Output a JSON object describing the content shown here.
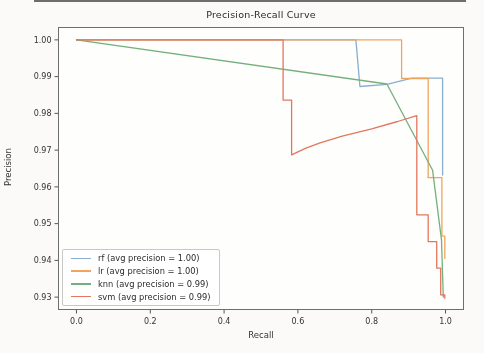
{
  "figure": {
    "title": "Precision-Recall Curve",
    "xlabel": "Recall",
    "ylabel": "Precision"
  },
  "chart_data": {
    "type": "line",
    "title": "Precision-Recall Curve",
    "xlabel": "Recall",
    "ylabel": "Precision",
    "xlim": [
      -0.05,
      1.05
    ],
    "ylim": [
      0.9265,
      1.0035
    ],
    "grid": false,
    "legend_position": "lower left",
    "x_ticks": [
      0.0,
      0.2,
      0.4,
      0.6,
      0.8,
      1.0
    ],
    "x_tick_labels": [
      "0.0",
      "0.2",
      "0.4",
      "0.6",
      "0.8",
      "1.0"
    ],
    "y_ticks": [
      1.0,
      0.99,
      0.98,
      0.97,
      0.96,
      0.95,
      0.94,
      0.93
    ],
    "y_tick_labels": [
      "1.00",
      "0.99",
      "0.98",
      "0.97",
      "0.96",
      "0.95",
      "0.94",
      "0.93"
    ],
    "series": [
      {
        "name": "rf",
        "label": "rf (avg precision = 1.00)",
        "avg_precision": "1.00",
        "color": "#8aaecd",
        "points": [
          [
            0.0,
            1.0
          ],
          [
            0.757,
            1.0
          ],
          [
            0.768,
            0.9873
          ],
          [
            0.841,
            0.9879
          ],
          [
            0.909,
            0.9896
          ],
          [
            0.992,
            0.9896
          ],
          [
            0.992,
            0.9632
          ]
        ]
      },
      {
        "name": "lr",
        "label": "lr (avg precision = 1.00)",
        "avg_precision": "1.00",
        "color": "#f0a55e",
        "points": [
          [
            0.0,
            1.0
          ],
          [
            0.881,
            1.0
          ],
          [
            0.881,
            0.9895
          ],
          [
            0.953,
            0.9895
          ],
          [
            0.953,
            0.9625
          ],
          [
            0.99,
            0.9625
          ],
          [
            0.99,
            0.9466
          ],
          [
            0.998,
            0.9466
          ],
          [
            0.998,
            0.9405
          ]
        ]
      },
      {
        "name": "knn",
        "label": "knn (avg precision = 0.99)",
        "avg_precision": "0.99",
        "color": "#74b07c",
        "points": [
          [
            0.0,
            1.0
          ],
          [
            0.841,
            0.988
          ],
          [
            0.965,
            0.9645
          ],
          [
            0.989,
            0.9456
          ],
          [
            0.994,
            0.93
          ]
        ]
      },
      {
        "name": "svm",
        "label": "svm (avg precision = 0.99)",
        "avg_precision": "0.99",
        "color": "#e4765c",
        "points": [
          [
            0.0,
            1.0
          ],
          [
            0.56,
            1.0
          ],
          [
            0.56,
            0.9836
          ],
          [
            0.583,
            0.9836
          ],
          [
            0.583,
            0.9687
          ],
          [
            0.62,
            0.9705
          ],
          [
            0.66,
            0.972
          ],
          [
            0.72,
            0.9738
          ],
          [
            0.8,
            0.9758
          ],
          [
            0.87,
            0.9778
          ],
          [
            0.922,
            0.9794
          ],
          [
            0.922,
            0.9524
          ],
          [
            0.953,
            0.9524
          ],
          [
            0.953,
            0.9451
          ],
          [
            0.976,
            0.9451
          ],
          [
            0.976,
            0.9379
          ],
          [
            0.987,
            0.9379
          ],
          [
            0.987,
            0.9306
          ],
          [
            0.998,
            0.9306
          ],
          [
            0.998,
            0.9297
          ]
        ]
      }
    ]
  }
}
